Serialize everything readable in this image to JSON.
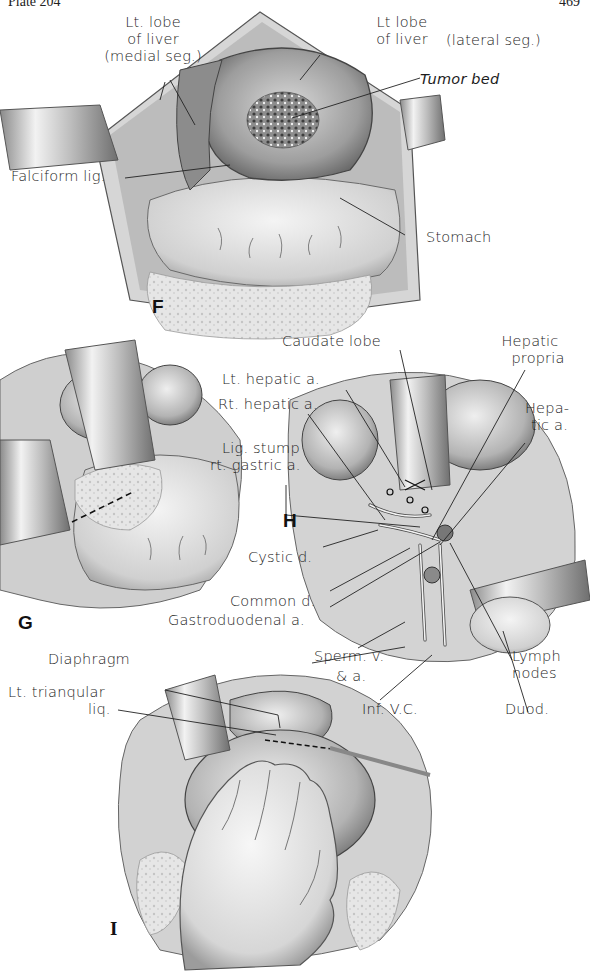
{
  "header": {
    "plate": "Plate 204",
    "page": "469"
  },
  "panels": {
    "F": {
      "letter": "F",
      "labels": {
        "lt_lobe_medial_1": "Lt. lobe",
        "lt_lobe_medial_2": "of liver",
        "lt_lobe_medial_3": "(medial seg.)",
        "lt_lobe_lateral_1": "Lt lobe",
        "lt_lobe_lateral_2": "of liver",
        "lt_lobe_lateral_3": "(lateral seg.)",
        "tumor_bed": "Tumor bed",
        "falciform": "Falciform lig.",
        "stomach": "Stomach"
      }
    },
    "G": {
      "letter": "G"
    },
    "H": {
      "letter": "H",
      "labels": {
        "caudate": "Caudate lobe",
        "hepatic_propria_1": "Hepatic",
        "hepatic_propria_2": "propria",
        "lt_hepatic": "Lt. hepatic a.",
        "rt_hepatic": "Rt. hepatic a.",
        "hepatic_a_1": "Hepa-",
        "hepatic_a_2": "tic a.",
        "lig_stump_1": "Lig. stump",
        "lig_stump_2": "rt. gastric a.",
        "cystic": "Cystic d.",
        "common": "Common d.",
        "gastroduodenal": "Gastroduodenal a.",
        "sperm_v": "Sperm. v.",
        "sperm_a": "& a.",
        "inf_vc": "Inf. V.C.",
        "lymph_1": "Lymph",
        "lymph_2": "nodes",
        "duod": "Duod."
      }
    },
    "I": {
      "letter": "I",
      "labels": {
        "diaphragm": "Diaphragm",
        "lt_triangular_1": "Lt. trianqular",
        "lt_triangular_2": "liq."
      }
    }
  },
  "colors": {
    "ink": "#1c1c1c",
    "tissue_light": "#e9e9e9",
    "tissue_mid": "#bdbdbd",
    "tissue_dark": "#7a7a7a",
    "paper": "#ffffff"
  }
}
